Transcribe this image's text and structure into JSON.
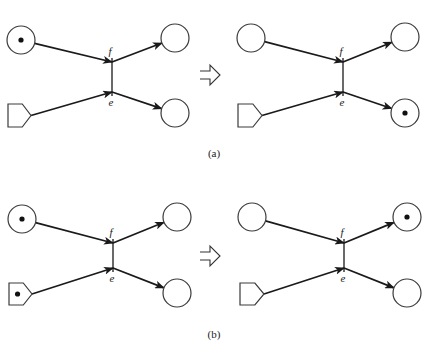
{
  "diagram": {
    "type": "petri-net-firing",
    "colors": {
      "ink": "#1a1a1a",
      "background": "#ffffff"
    },
    "panels": [
      {
        "id": "a",
        "caption": "(a)",
        "caption_pos": [
          214,
          157
        ],
        "implies_arrow": {
          "x": 200,
          "y": 75
        },
        "nets": [
          {
            "role": "before",
            "transition": {
              "x": 112,
              "y1": 62,
              "y2": 92,
              "label_top": "f",
              "label_bottom": "e"
            },
            "input_place": {
              "shape": "circle",
              "cx": 21,
              "cy": 40,
              "r": 14,
              "token": true
            },
            "input_inhibitor": {
              "shape": "pentagon",
              "x": 8,
              "y": 104,
              "w": 23,
              "h": 23,
              "token": false
            },
            "output_top": {
              "shape": "circle",
              "cx": 175,
              "cy": 38,
              "r": 14,
              "token": false
            },
            "output_bottom": {
              "shape": "circle",
              "cx": 175,
              "cy": 113,
              "r": 14,
              "token": false
            }
          },
          {
            "role": "after",
            "transition": {
              "x": 343,
              "y1": 62,
              "y2": 92,
              "label_top": "f",
              "label_bottom": "e"
            },
            "input_place": {
              "shape": "circle",
              "cx": 251,
              "cy": 38,
              "r": 14,
              "token": false
            },
            "input_inhibitor": {
              "shape": "pentagon",
              "x": 238,
              "y": 104,
              "w": 24,
              "h": 23,
              "token": false
            },
            "output_top": {
              "shape": "circle",
              "cx": 405,
              "cy": 37,
              "r": 14,
              "token": false
            },
            "output_bottom": {
              "shape": "circle",
              "cx": 405,
              "cy": 113,
              "r": 14,
              "token": true
            }
          }
        ]
      },
      {
        "id": "b",
        "caption": "(b)",
        "caption_pos": [
          214,
          338
        ],
        "implies_arrow": {
          "x": 200,
          "y": 256
        },
        "nets": [
          {
            "role": "before",
            "transition": {
              "x": 113,
              "y1": 243,
              "y2": 268,
              "label_top": "f",
              "label_bottom": "e"
            },
            "input_place": {
              "shape": "circle",
              "cx": 22,
              "cy": 219,
              "r": 14,
              "token": true
            },
            "input_inhibitor": {
              "shape": "pentagon",
              "x": 9,
              "y": 283,
              "w": 23,
              "h": 22,
              "token": true
            },
            "output_top": {
              "shape": "circle",
              "cx": 177,
              "cy": 217,
              "r": 14,
              "token": false
            },
            "output_bottom": {
              "shape": "circle",
              "cx": 177,
              "cy": 293,
              "r": 14,
              "token": false
            }
          },
          {
            "role": "after",
            "transition": {
              "x": 344,
              "y1": 243,
              "y2": 268,
              "label_top": "f",
              "label_bottom": "e"
            },
            "input_place": {
              "shape": "circle",
              "cx": 252,
              "cy": 217,
              "r": 14,
              "token": false
            },
            "input_inhibitor": {
              "shape": "pentagon",
              "x": 240,
              "y": 283,
              "w": 24,
              "h": 22,
              "token": false
            },
            "output_top": {
              "shape": "circle",
              "cx": 407,
              "cy": 217,
              "r": 14,
              "token": true
            },
            "output_bottom": {
              "shape": "circle",
              "cx": 407,
              "cy": 293,
              "r": 14,
              "token": false
            }
          }
        ]
      }
    ]
  }
}
